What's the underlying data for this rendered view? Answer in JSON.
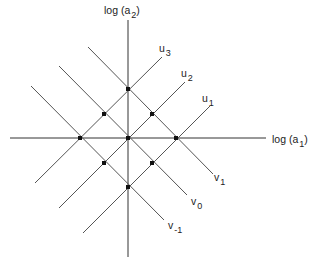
{
  "diagram": {
    "type": "lattice-diagram",
    "axes": {
      "x_label_pre": "log  (a",
      "x_label_sub": "1",
      "x_label_post": ")",
      "y_label_pre": "log (a",
      "y_label_sub": "2",
      "y_label_post": ")"
    },
    "u_lines": [
      {
        "name": "u",
        "sub": "1"
      },
      {
        "name": "u",
        "sub": "2"
      },
      {
        "name": "u",
        "sub": "3"
      }
    ],
    "v_lines": [
      {
        "name": "v",
        "sub": "1"
      },
      {
        "name": "v",
        "sub": "0"
      },
      {
        "name": "v",
        "sub": "-1"
      }
    ],
    "points_count": 9,
    "colors": {
      "line": "#555555",
      "axis": "#333333",
      "point": "#111111"
    }
  }
}
